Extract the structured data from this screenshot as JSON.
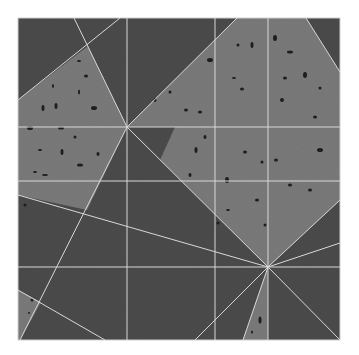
{
  "image": {
    "description": "Photograph of a square tiled floor panel with a speckled terrazzo-like texture, divided into light and dark triangular regions by thin light grout lines radiating from two focal points.",
    "subject": "geometric tile floor pattern",
    "colors": {
      "background": "#ffffff",
      "dark_tile": "#4b4b4b",
      "light_tile": "#7a7a7a",
      "grout": "#d8d8d8",
      "speckle": "#1e1e1e"
    },
    "square": {
      "x": 18,
      "y": 18,
      "size": 322
    },
    "focal_points": [
      {
        "name": "upper-left-center",
        "x": 127,
        "y": 127
      },
      {
        "name": "lower-right-center",
        "x": 268,
        "y": 267
      }
    ],
    "grid_lines": {
      "vertical_x": [
        127,
        215,
        268
      ],
      "horizontal_y": [
        127,
        181,
        267
      ]
    }
  }
}
